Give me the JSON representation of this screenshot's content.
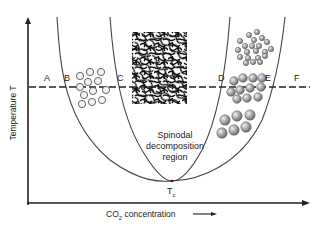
{
  "figure": {
    "title": "",
    "y_axis_label": "Temperature T",
    "x_axis_label_prefix": "CO",
    "x_axis_label_sub": "2",
    "x_axis_label_suffix": " concentration",
    "region_label_line1": "Spinodal",
    "region_label_line2": "decomposition",
    "region_label_line3": "region",
    "critical_point_main": "T",
    "critical_point_sub": "c",
    "points": {
      "A": "A",
      "B": "B",
      "C": "C",
      "D": "D",
      "E": "E",
      "F": "F"
    }
  },
  "colors": {
    "line": "#333333",
    "sphere_light": "#e6e6e6",
    "sphere_dark": "#8c8c8c",
    "background": "#ffffff"
  },
  "curves": {
    "binodal": "outer curve (B, E)",
    "spinodal": "inner curve (C, D)"
  },
  "regions": [
    {
      "name": "nucleation-left",
      "between": "B-C",
      "morphology": "small hollow droplets"
    },
    {
      "name": "spinodal",
      "between": "C-D",
      "morphology": "interconnected bicontinuous pattern"
    },
    {
      "name": "nucleation-right",
      "between": "D-E",
      "morphology": "shaded spheres (growing)"
    }
  ]
}
